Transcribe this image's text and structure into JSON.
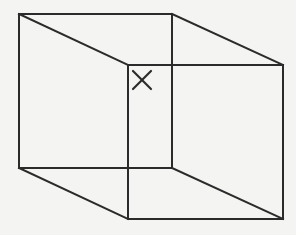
{
  "figure": {
    "title": "Wireframe cube with corner mark",
    "background_color": "#f4f4f3",
    "line_color": "#2b2b2b",
    "line_width": 2,
    "canvas": {
      "width": 296,
      "height": 235
    },
    "projection": {
      "type": "oblique-parallel",
      "depth_offset_x": 109,
      "depth_offset_y": 51
    },
    "faces": [
      {
        "name": "near-face",
        "label": "Near square face (upper-left)",
        "points": "19,14 172,14 172,168 19,168"
      },
      {
        "name": "far-face",
        "label": "Far square face (lower-right)",
        "points": "128,65 283,65 283,219 128,219"
      }
    ],
    "edges": [
      {
        "name": "near-face-top",
        "label": "Near face top edge",
        "x1": 19,
        "y1": 14,
        "x2": 172,
        "y2": 14
      },
      {
        "name": "near-face-right",
        "label": "Near face right edge",
        "x1": 172,
        "y1": 14,
        "x2": 172,
        "y2": 168
      },
      {
        "name": "near-face-bottom",
        "label": "Near face bottom edge",
        "x1": 172,
        "y1": 168,
        "x2": 19,
        "y2": 168
      },
      {
        "name": "near-face-left",
        "label": "Near face left edge",
        "x1": 19,
        "y1": 168,
        "x2": 19,
        "y2": 14
      },
      {
        "name": "far-face-top",
        "label": "Far face top edge",
        "x1": 128,
        "y1": 65,
        "x2": 283,
        "y2": 65
      },
      {
        "name": "far-face-right",
        "label": "Far face right edge",
        "x1": 283,
        "y1": 65,
        "x2": 283,
        "y2": 219
      },
      {
        "name": "far-face-bottom",
        "label": "Far face bottom edge",
        "x1": 283,
        "y1": 219,
        "x2": 128,
        "y2": 219
      },
      {
        "name": "far-face-left",
        "label": "Far face left edge",
        "x1": 128,
        "y1": 219,
        "x2": 128,
        "y2": 65
      },
      {
        "name": "connector-top-left",
        "label": "Depth edge, top-left",
        "x1": 19,
        "y1": 14,
        "x2": 128,
        "y2": 65
      },
      {
        "name": "connector-top-right",
        "label": "Depth edge, top-right",
        "x1": 172,
        "y1": 14,
        "x2": 283,
        "y2": 65
      },
      {
        "name": "connector-bottom-left",
        "label": "Depth edge, bottom-left",
        "x1": 19,
        "y1": 168,
        "x2": 128,
        "y2": 219
      },
      {
        "name": "connector-bottom-right",
        "label": "Depth edge, bottom-right",
        "x1": 172,
        "y1": 168,
        "x2": 283,
        "y2": 219
      }
    ],
    "vertices": [
      {
        "name": "near-top-left",
        "x": 19,
        "y": 14
      },
      {
        "name": "near-top-right",
        "x": 172,
        "y": 14
      },
      {
        "name": "near-bottom-right",
        "x": 172,
        "y": 168
      },
      {
        "name": "near-bottom-left",
        "x": 19,
        "y": 168
      },
      {
        "name": "far-top-left",
        "x": 128,
        "y": 65
      },
      {
        "name": "far-top-right",
        "x": 283,
        "y": 65
      },
      {
        "name": "far-bottom-right",
        "x": 283,
        "y": 219
      },
      {
        "name": "far-bottom-left",
        "x": 128,
        "y": 219
      }
    ],
    "mark": {
      "name": "x-mark",
      "symbol": "X",
      "label": "X mark at far face upper-left corner region",
      "center_x": 142,
      "center_y": 80,
      "size": 18,
      "stroke1": {
        "x1": 133,
        "y1": 71,
        "x2": 151,
        "y2": 89
      },
      "stroke2": {
        "x1": 151,
        "y1": 71,
        "x2": 133,
        "y2": 89
      }
    }
  }
}
